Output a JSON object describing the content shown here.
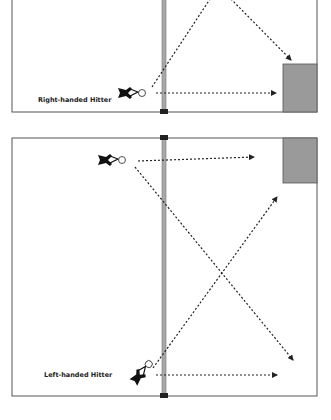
{
  "colors": {
    "court_line": "#555555",
    "net": "#a8a8a8",
    "net_post": "#222222",
    "target_zone": "#9a9a9a",
    "arrow": "#222222",
    "player": "#111111"
  },
  "courts": [
    {
      "id": "top",
      "label": "Right-handed Hitter",
      "court": {
        "x": 12,
        "y": -2,
        "w": 305,
        "h": 114
      },
      "net": {
        "x": 162,
        "post_y": 109
      },
      "target_zone": {
        "x": 283,
        "y": 64,
        "w": 34,
        "h": 48
      },
      "player": {
        "x": 130,
        "y": 98,
        "orient": "right"
      },
      "label_pos": {
        "x": 38,
        "y": 102
      },
      "arrows": [
        {
          "x1": 152,
          "y1": 87,
          "x2": 212,
          "y2": -4,
          "head": false
        },
        {
          "x1": 228,
          "y1": -4,
          "x2": 291,
          "y2": 60,
          "head": true
        },
        {
          "x1": 156,
          "y1": 93,
          "x2": 276,
          "y2": 93,
          "head": true
        }
      ]
    },
    {
      "id": "bottom",
      "label": "Left-handed Hitter",
      "court": {
        "x": 12,
        "y": 138,
        "w": 305,
        "h": 258
      },
      "net": {
        "x": 162,
        "post_y_top": 135,
        "post_y_bottom": 393
      },
      "target_zone": {
        "x": 283,
        "y": 138,
        "w": 34,
        "h": 45
      },
      "player": {
        "x": 112,
        "y": 160,
        "orient": "right"
      },
      "player2": {
        "x": 130,
        "y": 376,
        "orient": "diag"
      },
      "label_pos": {
        "x": 44,
        "y": 377
      },
      "arrows": [
        {
          "x1": 138,
          "y1": 161,
          "x2": 254,
          "y2": 157,
          "head": true
        },
        {
          "x1": 135,
          "y1": 167,
          "x2": 293,
          "y2": 360,
          "head": true
        },
        {
          "x1": 153,
          "y1": 368,
          "x2": 277,
          "y2": 197,
          "head": true
        },
        {
          "x1": 156,
          "y1": 375,
          "x2": 277,
          "y2": 375,
          "head": true
        }
      ]
    }
  ]
}
